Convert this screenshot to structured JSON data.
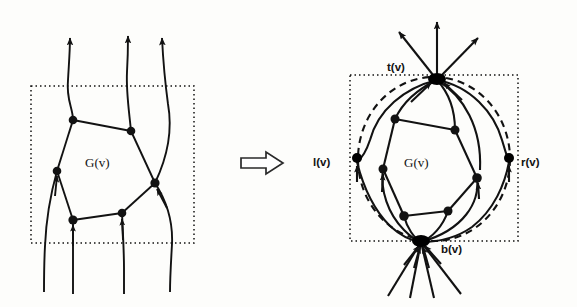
{
  "figure": {
    "background_color": "#fdfdfb",
    "ink_color": "#121212",
    "transform_symbol": "double-right-arrow"
  },
  "left_panel": {
    "name": "before",
    "region_label": "G(v)",
    "boundary_style": "dotted-rectangle",
    "boundary": {
      "x": 31,
      "y": 86,
      "width": 163,
      "height": 157
    },
    "vertices": [
      {
        "id": "a",
        "x": 73,
        "y": 120
      },
      {
        "id": "b",
        "x": 131,
        "y": 131
      },
      {
        "id": "c",
        "x": 155,
        "y": 183
      },
      {
        "id": "d",
        "x": 122,
        "y": 213
      },
      {
        "id": "e",
        "x": 73,
        "y": 220
      },
      {
        "id": "f",
        "x": 57,
        "y": 171
      }
    ],
    "inner_edges": [
      [
        "a",
        "b"
      ],
      [
        "b",
        "c"
      ],
      [
        "c",
        "d"
      ],
      [
        "d",
        "e"
      ],
      [
        "e",
        "f"
      ],
      [
        "f",
        "a"
      ]
    ],
    "outgoing_up_count": 3,
    "outgoing_down_count": 4
  },
  "right_panel": {
    "name": "after",
    "region_label": "G(v)",
    "boundary_style": "dotted-rectangle",
    "boundary": {
      "x": 350,
      "y": 75,
      "width": 168,
      "height": 166
    },
    "circle_style": "dashed-ellipse",
    "poles": [
      {
        "id": "t",
        "label": "t(v)",
        "x": 437,
        "y": 77,
        "position": "top"
      },
      {
        "id": "b",
        "label": "b(v)",
        "x": 421,
        "y": 240,
        "position": "bottom"
      },
      {
        "id": "l",
        "label": "l(v)",
        "x": 357,
        "y": 160,
        "position": "left"
      },
      {
        "id": "r",
        "label": "r(v)",
        "x": 509,
        "y": 160,
        "position": "right"
      }
    ],
    "vertices": [
      {
        "id": "a",
        "x": 395,
        "y": 119
      },
      {
        "id": "b",
        "x": 455,
        "y": 130
      },
      {
        "id": "c",
        "x": 477,
        "y": 178
      },
      {
        "id": "d",
        "x": 448,
        "y": 211
      },
      {
        "id": "e",
        "x": 404,
        "y": 216
      },
      {
        "id": "f",
        "x": 383,
        "y": 169
      }
    ],
    "inner_edges": [
      [
        "a",
        "b"
      ],
      [
        "b",
        "c"
      ],
      [
        "c",
        "d"
      ],
      [
        "d",
        "e"
      ],
      [
        "e",
        "f"
      ],
      [
        "f",
        "a"
      ]
    ],
    "outgoing_top_count": 3,
    "outgoing_bottom_count": 4
  },
  "labels": {
    "g_of_v": "G(v)",
    "t_of_v": "t(v)",
    "b_of_v": "b(v)",
    "l_of_v": "l(v)",
    "r_of_v": "r(v)"
  }
}
